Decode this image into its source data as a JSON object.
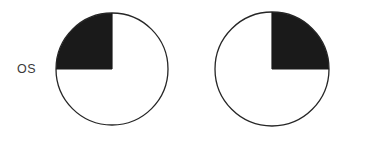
{
  "figure": {
    "type": "visual-field-quadrant-diagram",
    "background_color": "#ffffff",
    "fill_color": "#1a1a1a",
    "outline_color": "#262626",
    "outline_width_px": 1.3,
    "label_color": "#3a3a3a"
  },
  "eyes": [
    {
      "id": "os",
      "label": "OS",
      "label_position": "left",
      "circle": {
        "cx": 112,
        "cy": 69,
        "r": 56
      },
      "shaded_quadrant": "upper-left",
      "shaded_fraction": 0.25,
      "shaded_angles_deg": [
        180,
        270
      ],
      "quadrants": {
        "upper-left": "filled",
        "upper-right": "empty",
        "lower-left": "empty",
        "lower-right": "empty"
      }
    },
    {
      "id": "od",
      "label": "OD",
      "label_position": "right",
      "circle": {
        "cx": 80,
        "cy": 69,
        "r": 57
      },
      "shaded_quadrant": "upper-right",
      "shaded_fraction": 0.25,
      "shaded_angles_deg": [
        270,
        360
      ],
      "quadrants": {
        "upper-left": "empty",
        "upper-right": "filled",
        "lower-left": "empty",
        "lower-right": "empty"
      }
    }
  ]
}
